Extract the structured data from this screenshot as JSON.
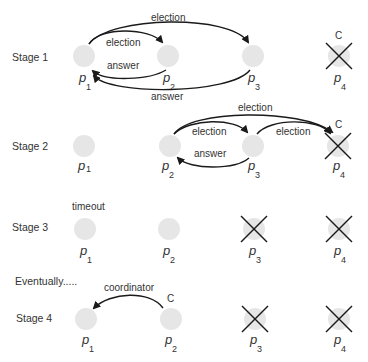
{
  "diagram": {
    "node_color": "#e6e6e6",
    "stroke_color": "#1a1a1a",
    "processes": [
      "p1",
      "p2",
      "p3",
      "p4"
    ],
    "stages": [
      {
        "label": "Stage 1",
        "crashed": [
          "p4"
        ],
        "coordinator_marker": {
          "on": "p4",
          "label": "C"
        },
        "messages": [
          {
            "from": "p1",
            "to": "p2",
            "label": "election"
          },
          {
            "from": "p1",
            "to": "p3",
            "label": "election"
          },
          {
            "from": "p2",
            "to": "p1",
            "label": "answer"
          },
          {
            "from": "p3",
            "to": "p1",
            "label": "answer"
          }
        ]
      },
      {
        "label": "Stage 2",
        "crashed": [
          "p4"
        ],
        "coordinator_marker": {
          "on": "p4",
          "label": "C"
        },
        "messages": [
          {
            "from": "p2",
            "to": "p3",
            "label": "election"
          },
          {
            "from": "p2",
            "to": "p4",
            "label": "election"
          },
          {
            "from": "p3",
            "to": "p4",
            "label": "election"
          },
          {
            "from": "p3",
            "to": "p2",
            "label": "answer"
          }
        ]
      },
      {
        "label": "Stage 3",
        "crashed": [
          "p3",
          "p4"
        ],
        "annotation": {
          "on": "p1",
          "label": "timeout"
        },
        "messages": []
      },
      {
        "label": "Stage 4",
        "crashed": [
          "p3",
          "p4"
        ],
        "coordinator_marker": {
          "on": "p2",
          "label": "C"
        },
        "messages": [
          {
            "from": "p2",
            "to": "p1",
            "label": "coordinator"
          }
        ]
      }
    ],
    "interlude": "Eventually.....",
    "labels": {
      "stage1": "Stage 1",
      "stage2": "Stage 2",
      "stage3": "Stage 3",
      "stage4": "Stage 4",
      "eventually": "Eventually.....",
      "election": "election",
      "answer": "answer",
      "timeout": "timeout",
      "coordinator": "coordinator",
      "c": "C",
      "p": "p",
      "sub1": "1",
      "sub2": "2",
      "sub3": "3",
      "sub4": "4"
    }
  }
}
